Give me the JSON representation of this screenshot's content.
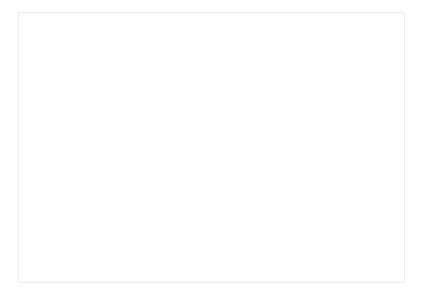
{
  "chart_data": {
    "type": "line",
    "title": "",
    "xlabel": "Year",
    "ylabel": "Tithe",
    "grid": true,
    "legend": false,
    "xlim": [
      1900,
      2015
    ],
    "ylim": [
      0,
      1200000000
    ],
    "ytick_values": [
      0,
      200000000,
      400000000,
      600000000,
      800000000,
      1000000000,
      1200000000
    ],
    "ytick_labels": [
      "$0",
      "$200,000,000",
      "$400,000,000",
      "$600,000,000",
      "$800,000,000",
      "$1,000,000,000",
      "$1,200,000,000"
    ],
    "categories": [
      "1900",
      "1905",
      "1910",
      "1915",
      "1920",
      "1925",
      "1930",
      "1935",
      "1940",
      "1945",
      "1950",
      "1955",
      "1960",
      "1965",
      "1970",
      "1975",
      "1980",
      "1985",
      "1990",
      "1995",
      "2000",
      "2005",
      "2010",
      "2015"
    ],
    "series": [
      {
        "name": "Tithe",
        "color": "#3a3a3a",
        "values": [
          1200000,
          1600000,
          2100000,
          2600000,
          3400000,
          4100000,
          4000000,
          3600000,
          4500000,
          7000000,
          11000000,
          17000000,
          26000000,
          45000000,
          80000000,
          140000000,
          225000000,
          310000000,
          400000000,
          505000000,
          660000000,
          820000000,
          880000000,
          950000000
        ]
      }
    ]
  },
  "axis": {
    "x_title": "Year",
    "y_title": "Tithe"
  }
}
